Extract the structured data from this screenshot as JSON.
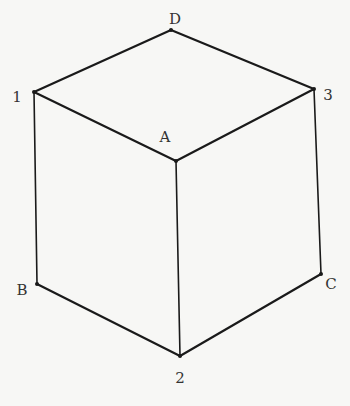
{
  "diagram": {
    "type": "isometric cube",
    "vertices": [
      {
        "id": "D",
        "label": "D",
        "x": 171,
        "y": 30,
        "lx": 175,
        "ly": 19
      },
      {
        "id": "1",
        "label": "1",
        "x": 34,
        "y": 92,
        "lx": 17,
        "ly": 97
      },
      {
        "id": "3",
        "label": "3",
        "x": 314,
        "y": 89,
        "lx": 328,
        "ly": 95
      },
      {
        "id": "A",
        "label": "A",
        "x": 176,
        "y": 161,
        "lx": 165,
        "ly": 137
      },
      {
        "id": "B",
        "label": "B",
        "x": 37,
        "y": 284,
        "lx": 22,
        "ly": 290
      },
      {
        "id": "2",
        "label": "2",
        "x": 180,
        "y": 356,
        "lx": 180,
        "ly": 378
      },
      {
        "id": "C",
        "label": "C",
        "x": 321,
        "y": 274,
        "lx": 331,
        "ly": 284
      }
    ],
    "edges": [
      [
        "1",
        "D"
      ],
      [
        "D",
        "3"
      ],
      [
        "1",
        "A"
      ],
      [
        "A",
        "3"
      ],
      [
        "1",
        "B"
      ],
      [
        "A",
        "2"
      ],
      [
        "3",
        "C"
      ],
      [
        "B",
        "2"
      ],
      [
        "2",
        "C"
      ]
    ],
    "stroke_color": "#1a1a1a"
  }
}
